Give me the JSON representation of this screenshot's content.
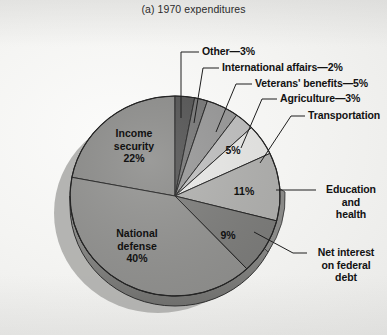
{
  "figure": {
    "title": "(a) 1970 expenditures"
  },
  "chart_data": {
    "type": "pie",
    "title": "(a) 1970 expenditures",
    "xlabel": "",
    "ylabel": "",
    "units": "percent",
    "total": 100,
    "legend_position": "callout-labels",
    "grid": false,
    "categories": [
      "Other",
      "International affairs",
      "Veterans' benefits",
      "Agriculture",
      "Transportation",
      "Education and health",
      "Net interest on federal debt",
      "National defense",
      "Income security"
    ],
    "values": [
      3,
      2,
      5,
      3,
      5,
      11,
      9,
      40,
      22
    ],
    "slices": [
      {
        "label": "Other",
        "value": 3,
        "pct_text": "3%",
        "color": "#555555",
        "label_text": "Other—3%",
        "label_kind": "callout"
      },
      {
        "label": "International affairs",
        "value": 2,
        "pct_text": "2%",
        "color": "#787878",
        "label_text": "International affairs—2%",
        "label_kind": "callout"
      },
      {
        "label": "Veterans' benefits",
        "value": 5,
        "pct_text": "5%",
        "color": "#9a9a9a",
        "label_text": "Veterans' benefits—5%",
        "label_kind": "callout"
      },
      {
        "label": "Agriculture",
        "value": 3,
        "pct_text": "3%",
        "color": "#c2c2c2",
        "label_text": "Agriculture—3%",
        "label_kind": "callout"
      },
      {
        "label": "Transportation",
        "value": 5,
        "pct_text": "5%",
        "color": "#ececea",
        "label_text": "Transportation",
        "label_kind": "callout"
      },
      {
        "label": "Education and health",
        "value": 11,
        "pct_text": "11%",
        "color": "#b4b4b2",
        "label_text": "Education and health",
        "label_kind": "callout"
      },
      {
        "label": "Net interest on federal debt",
        "value": 9,
        "pct_text": "9%",
        "color": "#7f7f7d",
        "label_text": "Net interest on federal debt",
        "label_kind": "callout"
      },
      {
        "label": "National defense",
        "value": 40,
        "pct_text": "40%",
        "color": "#949492",
        "label_text": "National defense",
        "label_kind": "inside"
      },
      {
        "label": "Income security",
        "value": 22,
        "pct_text": "22%",
        "color": "#8e8e8c",
        "label_text": "Income security",
        "label_kind": "inside"
      }
    ]
  },
  "callouts": {
    "other": "Other—3%",
    "international_affairs": "International affairs—2%",
    "veterans_benefits": "Veterans' benefits—5%",
    "agriculture": "Agriculture—3%",
    "transportation": "Transportation",
    "education_health_line1": "Education",
    "education_health_line2": "and",
    "education_health_line3": "health",
    "net_interest_line1": "Net interest",
    "net_interest_line2": "on federal",
    "net_interest_line3": "debt"
  },
  "inside_labels": {
    "income_security_line1": "Income",
    "income_security_line2": "security",
    "income_security_pct": "22%",
    "national_defense_line1": "National",
    "national_defense_line2": "defense",
    "national_defense_pct": "40%",
    "transportation_pct": "5%",
    "education_health_pct": "11%",
    "net_interest_pct": "9%"
  }
}
